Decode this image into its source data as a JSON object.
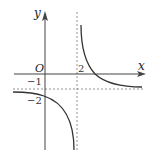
{
  "diagram": {
    "type": "function-graph",
    "axes": {
      "x_label": "x",
      "y_label": "y",
      "origin_label": "O"
    },
    "ticks": {
      "x_tick_2": "2",
      "y_tick_neg1": "−1",
      "y_tick_neg2": "−2"
    },
    "asymptotes": {
      "vertical": "x = 2",
      "horizontal": "y = -1",
      "style": "dashed"
    },
    "branches": [
      {
        "name": "upper-right",
        "description": "descends from +infinity near x=2, crosses x-axis, approaches y=-1"
      },
      {
        "name": "lower-left",
        "description": "approaches y=-1 from below on the left, passes (0,-2), descends to -infinity near x=2"
      }
    ],
    "colors": {
      "curve": "#333333",
      "axis": "#444444",
      "dashed": "#777777"
    }
  }
}
